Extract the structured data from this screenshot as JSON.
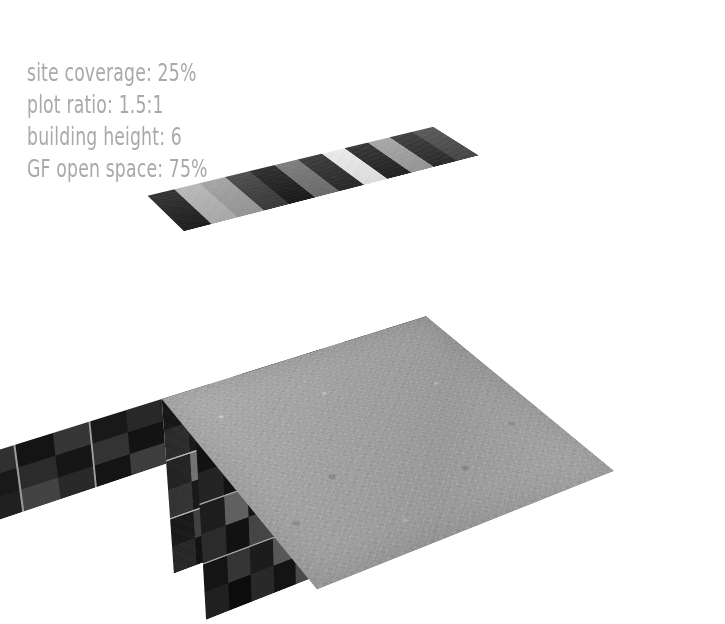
{
  "background_color": "#ffffff",
  "annotations": {
    "text_color": "#a9a9a9",
    "lines": [
      {
        "label": "site coverage:",
        "value": "25%",
        "full": "site coverage: 25%"
      },
      {
        "label": "plot ratio:",
        "value": "1.5:1",
        "full": "plot ratio: 1.5:1"
      },
      {
        "label": "building height:",
        "value": "6",
        "full": "building height: 6"
      },
      {
        "label": "GF open space:",
        "value": "75%",
        "full": "GF open space: 75%"
      }
    ]
  },
  "scene": {
    "type": "architectural-massing-render",
    "description": "Isometric/perspective render of a rectangular slab building standing on a textured grey ground plane",
    "ground": {
      "name": "site-ground-plane",
      "material": "concrete-texture",
      "base_color": "#a5a5a5",
      "edge_color": "#6e6e6e"
    },
    "building": {
      "name": "slab-building-massing",
      "storeys": 6,
      "bays_long": 12,
      "bays_short": 3,
      "facade_palette": [
        "#151515",
        "#1d1d1d",
        "#262626",
        "#2f2f2f",
        "#3a3a3a",
        "#454545",
        "#515151",
        "#5e5e5e",
        "#6e6e6e",
        "#808080",
        "#949494",
        "#a8a8a8",
        "#bcbcbc",
        "#d2d2d2",
        "#e4e4e4"
      ],
      "band_separator_color": "#e1e1e1",
      "floor_bands": 3
    }
  },
  "chart_data": {
    "type": "table",
    "categories": [
      "site coverage",
      "plot ratio",
      "building height",
      "GF open space"
    ],
    "values": [
      "25%",
      "1.5:1",
      "6",
      "75%"
    ],
    "units": [
      "percent",
      "ratio",
      "storeys",
      "percent"
    ]
  },
  "facade": {
    "front_rows": [
      [
        "#1a1a1a",
        "#2c2c2c",
        "#cfcfcf",
        "#3a3a3a",
        "#161616",
        "#6e6e6e",
        "#2a2a2a",
        "#e2e2e2",
        "#1e1e1e",
        "#8e8e8e",
        "#222222",
        "#3f3f3f"
      ],
      [
        "#343434",
        "#1c1c1c",
        "#555555",
        "#222222",
        "#3c3c3c",
        "#151515",
        "#777777",
        "#2a2a2a",
        "#4a4a4a",
        "#1b1b1b",
        "#606060",
        "#2e2e2e"
      ],
      [
        "#2a2a2a",
        "#8a8a8a",
        "#1f1f1f",
        "#454545",
        "#141414",
        "#5a5a5a",
        "#262626",
        "#3b3b3b",
        "#6b6b6b",
        "#1d1d1d",
        "#4f4f4f",
        "#232323"
      ],
      [
        "#3e3e3e",
        "#1b1b1b",
        "#646464",
        "#2d2d2d",
        "#515151",
        "#1a1a1a",
        "#3a3a3a",
        "#7a7a7a",
        "#202020",
        "#464646",
        "#171717",
        "#585858"
      ],
      [
        "#1d1d1d",
        "#4d4d4d",
        "#292929",
        "#7e7e7e",
        "#1a1a1a",
        "#3f3f3f",
        "#585858",
        "#1e1e1e",
        "#343434",
        "#5f5f5f",
        "#252525",
        "#424242"
      ],
      [
        "#2f2f2f",
        "#121212",
        "#3b3b3b",
        "#1e1e1e",
        "#6a6a6a",
        "#252525",
        "#4c4c4c",
        "#171717",
        "#8a8a8a",
        "#2b2b2b",
        "#3a3a3a",
        "#1a1a1a"
      ]
    ],
    "roof_cols": [
      "#1f1f1f",
      "#b4b4b4",
      "#9e9e9e",
      "#3c3c3c",
      "#1a1a1a",
      "#727272",
      "#2a2a2a",
      "#ececec",
      "#232323",
      "#a0a0a0",
      "#2d2d2d",
      "#4a4a4a"
    ],
    "end_rows": [
      [
        "#3a3a3a",
        "#1c1c1c",
        "#585858"
      ],
      [
        "#242424",
        "#4a4a4a",
        "#1e1e1e"
      ],
      [
        "#4e4e4e",
        "#202020",
        "#3c3c3c"
      ],
      [
        "#1d1d1d",
        "#3e3e3e",
        "#606060"
      ],
      [
        "#454545",
        "#242424",
        "#2e2e2e"
      ],
      [
        "#202020",
        "#525252",
        "#1a1a1a"
      ]
    ]
  }
}
